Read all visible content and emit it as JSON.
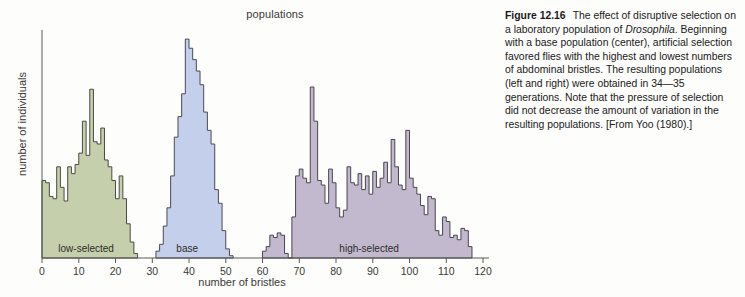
{
  "figure": {
    "caption_label": "Figure 12.16",
    "caption_text": "The effect of disruptive selection on a laboratory population of Drosophila. Beginning with a base population (center), artificial selection favored flies with the highest and lowest numbers of abdominal bristles. The resulting populations (left and right) were obtained in 34—35 generations. Note that the pressure of selection did not decrease the amount of variation in the resulting populations. [From Yoo (1980).]",
    "caption_part1": "The effect of disruptive selection on a laboratory population of ",
    "caption_italic": "Drosophila",
    "caption_part2": ". Beginning with a base population (center), artificial selection favored flies with the highest and lowest numbers of abdominal bristles. The resulting populations (left and right) were obtained in 34—35 generations. Note that the pressure of selection did not decrease the amount of variation in the resulting populations. [From Yoo (1980).]"
  },
  "chart_data": {
    "type": "bar",
    "title": "populations",
    "xlabel": "number of bristles",
    "ylabel": "number of individuals",
    "xlim": [
      0,
      120
    ],
    "ylim": [
      0,
      100
    ],
    "xticks": [
      0,
      10,
      20,
      30,
      40,
      50,
      60,
      70,
      80,
      90,
      100,
      110,
      120
    ],
    "xtick_labels": [
      "0",
      "10",
      "20",
      "30",
      "40",
      "50",
      "60",
      "70",
      "80",
      "90",
      "100",
      "110",
      "120"
    ],
    "grid": false,
    "legend": "inline-labels",
    "bin_width": 1,
    "series": [
      {
        "name": "low-selected",
        "label": "low-selected",
        "color": "#c6cfac",
        "edge_color": "#4a4a44",
        "label_x": 12,
        "x_start": 0,
        "values": [
          34,
          33,
          27,
          26,
          40,
          31,
          25,
          40,
          37,
          41,
          46,
          60,
          45,
          74,
          51,
          50,
          57,
          43,
          40,
          34,
          26,
          36,
          26,
          15,
          7,
          2
        ]
      },
      {
        "name": "base",
        "label": "base",
        "color": "#c3cfeb",
        "edge_color": "#4a4a54",
        "label_x": 39.5,
        "x_start": 31,
        "values": [
          3,
          6,
          14,
          22,
          36,
          53,
          62,
          72,
          96,
          92,
          87,
          82,
          76,
          64,
          56,
          50,
          30,
          24,
          12,
          4,
          1
        ]
      },
      {
        "name": "high-selected",
        "label": "high-selected",
        "color": "#c2b9cf",
        "edge_color": "#4a4650",
        "label_x": 89,
        "x_start": 60,
        "values": [
          3,
          5,
          10,
          9,
          11,
          10,
          2,
          0,
          18,
          36,
          39,
          35,
          33,
          75,
          60,
          34,
          32,
          24,
          39,
          33,
          22,
          18,
          21,
          40,
          33,
          32,
          37,
          30,
          36,
          28,
          38,
          31,
          35,
          42,
          33,
          52,
          40,
          32,
          30,
          56,
          35,
          31,
          28,
          23,
          19,
          27,
          26,
          12,
          10,
          18,
          16,
          9,
          10,
          8,
          13,
          12,
          5
        ]
      }
    ]
  }
}
